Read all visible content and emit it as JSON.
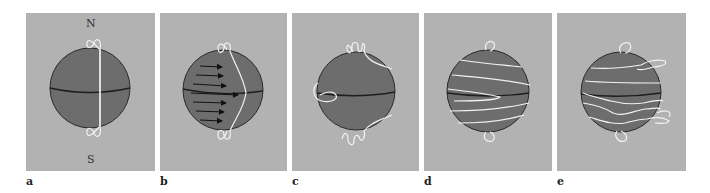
{
  "figure": {
    "colors": {
      "background": "#ffffff",
      "panel": "#b2b2b2",
      "sphere": "#6d6d6d",
      "field_line": "#f2f2f2",
      "outline": "#2a2a2a"
    },
    "panels": [
      {
        "id": "a",
        "label": "a",
        "pole_north": "N",
        "pole_south": "S",
        "content": "Sphere with single vertical (meridional) field line from pole to pole"
      },
      {
        "id": "b",
        "label": "b",
        "content": "Arrows of decreasing length toward poles indicate faster equatorial rotation; field line bulges eastward at equator"
      },
      {
        "id": "c",
        "label": "c",
        "content": "Field line wrapped once around the sphere near the equator"
      },
      {
        "id": "d",
        "label": "d",
        "content": "Field line wound many times into toroidal bands"
      },
      {
        "id": "e",
        "label": "e",
        "content": "Wound field becomes twisted and contorted, loops emerging"
      }
    ]
  }
}
